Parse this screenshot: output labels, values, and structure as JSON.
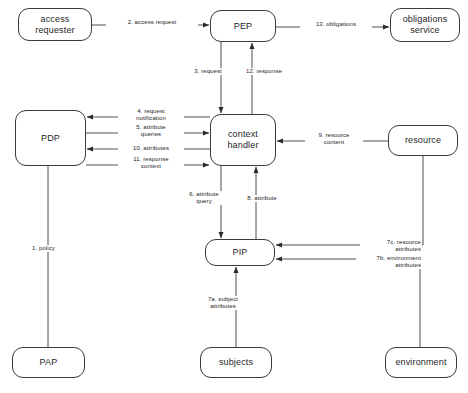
{
  "diagram": {
    "type": "flow-diagram",
    "stroke_color": "#3a3a3a",
    "text_color": "#262626",
    "background": "#ffffff",
    "nodes": [
      {
        "id": "access-requester",
        "label": "access\nrequester",
        "x": 18,
        "y": 8,
        "w": 74,
        "h": 33
      },
      {
        "id": "pep",
        "label": "PEP",
        "x": 210,
        "y": 10,
        "w": 66,
        "h": 32
      },
      {
        "id": "obligations-service",
        "label": "obligations\nservice",
        "x": 390,
        "y": 8,
        "w": 70,
        "h": 34
      },
      {
        "id": "pdp",
        "label": "PDP",
        "x": 15,
        "y": 110,
        "w": 71,
        "h": 56
      },
      {
        "id": "context-handler",
        "label": "context\nhandler",
        "x": 210,
        "y": 114,
        "w": 66,
        "h": 52
      },
      {
        "id": "resource",
        "label": "resource",
        "x": 388,
        "y": 125,
        "w": 70,
        "h": 31
      },
      {
        "id": "pip",
        "label": "PIP",
        "x": 205,
        "y": 239,
        "w": 70,
        "h": 27
      },
      {
        "id": "pap",
        "label": "PAP",
        "x": 12,
        "y": 347,
        "w": 73,
        "h": 31
      },
      {
        "id": "subjects",
        "label": "subjects",
        "x": 200,
        "y": 347,
        "w": 72,
        "h": 31
      },
      {
        "id": "environment",
        "label": "environment",
        "x": 385,
        "y": 347,
        "w": 72,
        "h": 31
      }
    ],
    "edges": [
      {
        "id": "edge-1-policy",
        "label": "1. policy",
        "from": "pap",
        "to": "pdp",
        "arrow": "none"
      },
      {
        "id": "edge-2-access-request",
        "label": "2. access request",
        "from": "access-requester",
        "to": "pep",
        "arrow": "to"
      },
      {
        "id": "edge-3-request",
        "label": "3. request",
        "from": "pep",
        "to": "context-handler",
        "arrow": "to"
      },
      {
        "id": "edge-4-request-notification",
        "label": "4. request\nnotification",
        "from": "context-handler",
        "to": "pdp",
        "arrow": "to"
      },
      {
        "id": "edge-5-attribute-queries",
        "label": "5. attribute\nqueries",
        "from": "pdp",
        "to": "context-handler",
        "arrow": "to"
      },
      {
        "id": "edge-6-attribute-query",
        "label": "6. attribute\nquery",
        "from": "context-handler",
        "to": "pip",
        "arrow": "to"
      },
      {
        "id": "edge-7a-subject-attributes",
        "label": "7a. subject\nattributes",
        "from": "subjects",
        "to": "pip",
        "arrow": "to"
      },
      {
        "id": "edge-7b-environment-attributes",
        "label": "7b. environment\nattributes",
        "from": "environment",
        "to": "pip",
        "arrow": "to"
      },
      {
        "id": "edge-7c-resource-attributes",
        "label": "7c. resource\nattributes",
        "from": "resource",
        "to": "pip",
        "arrow": "to"
      },
      {
        "id": "edge-8-attribute",
        "label": "8. attribute",
        "from": "pip",
        "to": "context-handler",
        "arrow": "to"
      },
      {
        "id": "edge-9-resource-content",
        "label": "9. resource\ncontent",
        "from": "resource",
        "to": "context-handler",
        "arrow": "to"
      },
      {
        "id": "edge-10-attributes",
        "label": "10. attributes",
        "from": "context-handler",
        "to": "pdp",
        "arrow": "to"
      },
      {
        "id": "edge-11-response-context",
        "label": "11. response\ncontext",
        "from": "pdp",
        "to": "context-handler",
        "arrow": "to"
      },
      {
        "id": "edge-12-response",
        "label": "12. response",
        "from": "context-handler",
        "to": "pep",
        "arrow": "to"
      },
      {
        "id": "edge-13-obligations",
        "label": "13. obligations",
        "from": "pep",
        "to": "obligations-service",
        "arrow": "to"
      }
    ]
  }
}
